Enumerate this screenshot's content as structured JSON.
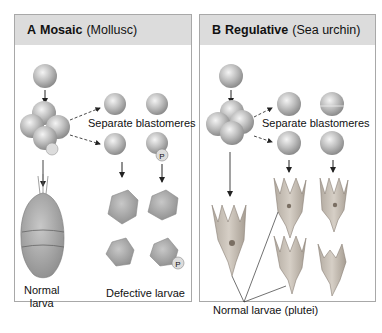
{
  "panels": [
    {
      "id": "A",
      "letter": "A",
      "title": "Mosaic",
      "organism": "(Mollusc)",
      "labels": {
        "separate": "Separate blastomeres",
        "normal_line1": "Normal",
        "normal_line2": "larva",
        "defective": "Defective larvae",
        "polar_lobe_marker": "P"
      }
    },
    {
      "id": "B",
      "letter": "B",
      "title": "Regulative",
      "organism": "(Sea urchin)",
      "labels": {
        "separate": "Separate blastomeres",
        "normal": "Normal larvae (plutei)"
      }
    }
  ],
  "colors": {
    "header_bg": "#dcdcdc",
    "border": "#a8a8a8",
    "cell_fill": "#b9b9b9",
    "larva_fill": "#a9a9a9",
    "pluteus_fill": "#c7bfb5"
  }
}
